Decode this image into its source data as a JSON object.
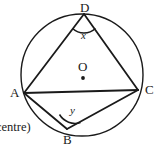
{
  "figure": {
    "type": "circle-geometry-diagram",
    "stroke_color": "#1a1a1a",
    "background_color": "#ffffff",
    "circle": {
      "center_x": 82,
      "center_y": 75,
      "radius": 61
    },
    "points": [
      {
        "id": "D",
        "label": "D",
        "x": 84,
        "y": 14
      },
      {
        "id": "A",
        "label": "A",
        "x": 24,
        "y": 93
      },
      {
        "id": "C",
        "label": "C",
        "x": 138,
        "y": 90
      },
      {
        "id": "B",
        "label": "B",
        "x": 67,
        "y": 129
      },
      {
        "id": "O",
        "label": "O",
        "x": 83,
        "y": 78
      }
    ],
    "segments": [
      {
        "from": "D",
        "to": "A"
      },
      {
        "from": "D",
        "to": "C"
      },
      {
        "from": "A",
        "to": "C"
      },
      {
        "from": "A",
        "to": "B"
      },
      {
        "from": "B",
        "to": "C"
      }
    ],
    "angles": [
      {
        "at": "D",
        "label": "x"
      },
      {
        "at": "B",
        "label": "y"
      }
    ],
    "caption": "centre)"
  }
}
